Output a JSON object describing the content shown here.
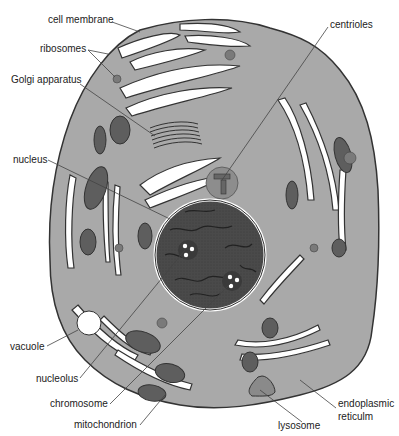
{
  "diagram": {
    "colors": {
      "cytoplasm": "#a9a9a9",
      "membrane": "#333333",
      "nucleus": "#4a4a4a",
      "organelle_dark": "#5e5e5e",
      "channel": "#ffffff",
      "leader_line": "#444444"
    },
    "labels": [
      {
        "id": "cell-membrane",
        "text": "cell membrane"
      },
      {
        "id": "ribosomes",
        "text": "ribosomes"
      },
      {
        "id": "golgi-apparatus",
        "text": "Golgi apparatus"
      },
      {
        "id": "centrioles",
        "text": "centrioles"
      },
      {
        "id": "nucleus",
        "text": "nucleus"
      },
      {
        "id": "vacuole",
        "text": "vacuole"
      },
      {
        "id": "nucleolus",
        "text": "nucleolus"
      },
      {
        "id": "chromosome",
        "text": "chromosome"
      },
      {
        "id": "mitochondrion",
        "text": "mitochondrion"
      },
      {
        "id": "lysosome",
        "text": "lysosome"
      },
      {
        "id": "endoplasmic-reticulum-line1",
        "text": "endoplasmic"
      },
      {
        "id": "endoplasmic-reticulum-line2",
        "text": "reticulm"
      }
    ]
  }
}
